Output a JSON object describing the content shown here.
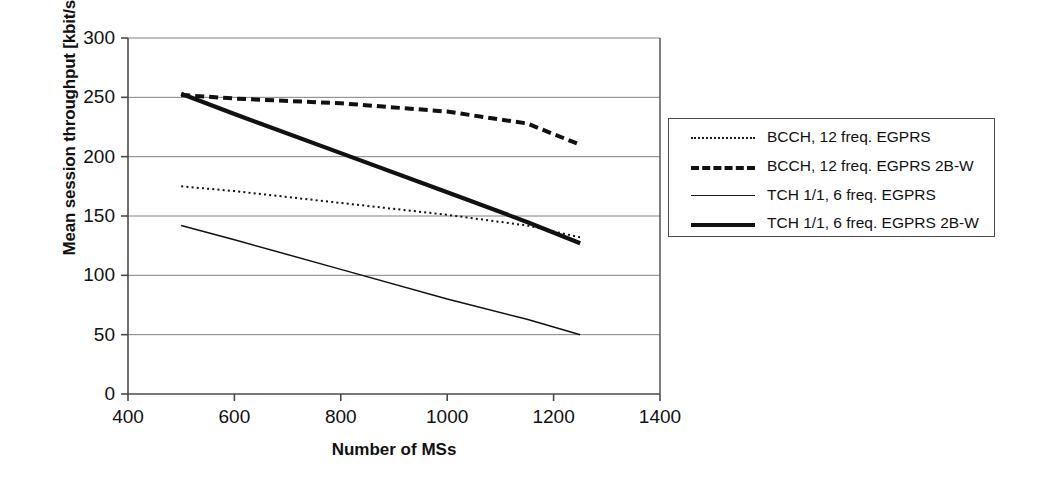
{
  "chart_data": {
    "type": "line",
    "title": "",
    "xlabel": "Number of MSs",
    "ylabel": "Mean session throughput [kbit/s]",
    "xlim": [
      400,
      1400
    ],
    "ylim": [
      0,
      300
    ],
    "xticks": [
      400,
      600,
      800,
      1000,
      1200,
      1400
    ],
    "yticks": [
      0,
      50,
      100,
      150,
      200,
      250,
      300
    ],
    "grid": "horizontal",
    "legend_position": "right-outside",
    "series": [
      {
        "name": "BCCH, 12 freq. EGPRS",
        "style": "dotted",
        "x": [
          500,
          600,
          800,
          1000,
          1150,
          1250
        ],
        "values": [
          175,
          171,
          161,
          151,
          142,
          132
        ]
      },
      {
        "name": "BCCH, 12 freq. EGPRS 2B-W",
        "style": "dashed",
        "x": [
          500,
          600,
          800,
          1000,
          1150,
          1250
        ],
        "values": [
          252,
          249,
          245,
          238,
          228,
          210
        ]
      },
      {
        "name": "TCH 1/1, 6 freq. EGPRS",
        "style": "thin-solid",
        "x": [
          500,
          600,
          800,
          1000,
          1150,
          1250
        ],
        "values": [
          142,
          130,
          105,
          80,
          63,
          50
        ]
      },
      {
        "name": "TCH 1/1, 6 freq. EGPRS 2B-W",
        "style": "thick-solid",
        "x": [
          500,
          600,
          800,
          1000,
          1150,
          1250
        ],
        "values": [
          253,
          236,
          203,
          170,
          145,
          127
        ]
      }
    ]
  },
  "legend": {
    "items": [
      {
        "label": "BCCH, 12 freq. EGPRS"
      },
      {
        "label": "BCCH, 12 freq. EGPRS 2B-W"
      },
      {
        "label": "TCH 1/1, 6 freq. EGPRS"
      },
      {
        "label": "TCH 1/1, 6 freq. EGPRS 2B-W"
      }
    ]
  },
  "colors": {
    "line": "#111111",
    "grid": "#808080",
    "axis": "#4a4a4a",
    "background": "#ffffff"
  }
}
